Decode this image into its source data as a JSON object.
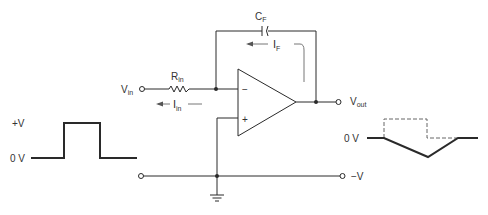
{
  "diagram": {
    "type": "integrator-op-amp-circuit",
    "labels": {
      "capacitor_main": "C",
      "capacitor_sub": "F",
      "feedback_current_main": "I",
      "feedback_current_sub": "F",
      "resistor_main": "R",
      "resistor_sub": "in",
      "input_current_main": "I",
      "input_current_sub": "in",
      "input_voltage_main": "V",
      "input_voltage_sub": "in",
      "output_voltage_main": "V",
      "output_voltage_sub": "out",
      "inverting_input": "−",
      "noninverting_input": "+",
      "negative_supply": "−V"
    },
    "input_waveform": {
      "high_label": "+V",
      "low_label": "0 V",
      "shape": "rectangular pulse"
    },
    "output_waveform": {
      "zero_label": "0 V",
      "shape": "negative ramp down then ramp back up (triangle), dashed reference pulse"
    }
  }
}
